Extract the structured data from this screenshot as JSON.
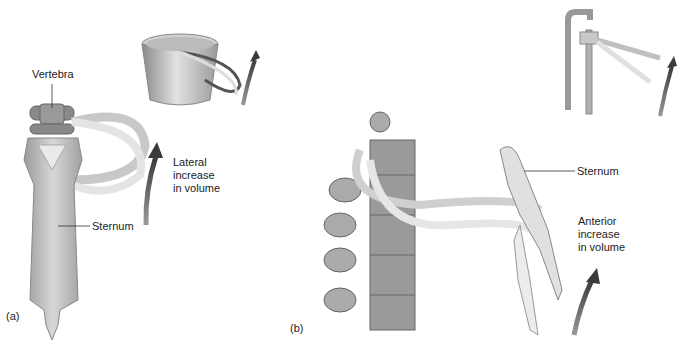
{
  "figure": {
    "panel_a": {
      "tag": "(a)",
      "labels": {
        "vertebra": "Vertebra",
        "sternum": "Sternum",
        "motion": "Lateral\nincrease\nin volume"
      },
      "analogy": "bucket-handle"
    },
    "panel_b": {
      "tag": "(b)",
      "labels": {
        "sternum": "Sternum",
        "motion": "Anterior\nincrease\nin volume"
      },
      "analogy": "pump-handle"
    },
    "colors": {
      "bone_light": "#e6e6e6",
      "bone_mid": "#bdbdbd",
      "bone_dark": "#8a8a8a",
      "arrow": "#4a4a4a",
      "leader_line": "#333333"
    }
  }
}
